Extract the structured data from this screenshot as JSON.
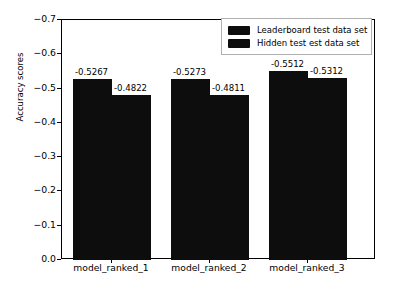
{
  "chart_data": {
    "type": "bar",
    "title": "",
    "xlabel": "",
    "ylabel": "Accuracy scores",
    "categories": [
      "model_ranked_1",
      "model_ranked_2",
      "model_ranked_3"
    ],
    "series": [
      {
        "name": "Leaderboard test data set",
        "values": [
          -0.5267,
          -0.4822,
          -0.5512
        ],
        "color": "#0d0d0d"
      },
      {
        "name": "Hidden test est data set",
        "values": [
          -0.4822,
          -0.4811,
          -0.5312
        ],
        "color": "#0d0d0d"
      }
    ],
    "bars": [
      {
        "group": "model_ranked_1",
        "series": "Leaderboard test data set",
        "value": -0.5267,
        "label": "-0.5267"
      },
      {
        "group": "model_ranked_1",
        "series": "Hidden test est data set",
        "value": -0.4822,
        "label": "-0.4822"
      },
      {
        "group": "model_ranked_2",
        "series": "Leaderboard test data set",
        "value": -0.5273,
        "label": "-0.5273"
      },
      {
        "group": "model_ranked_2",
        "series": "Hidden test est data set",
        "value": -0.4811,
        "label": "-0.4811"
      },
      {
        "group": "model_ranked_3",
        "series": "Leaderboard test data set",
        "value": -0.5512,
        "label": "-0.5512"
      },
      {
        "group": "model_ranked_3",
        "series": "Hidden test est data set",
        "value": -0.5312,
        "label": "-0.5312"
      }
    ],
    "yticks": [
      "-0.7",
      "-0.6",
      "-0.5",
      "-0.4",
      "-0.3",
      "-0.2",
      "-0.1",
      "0.0"
    ],
    "ylim": [
      0.0,
      -0.7
    ],
    "y_axis_inverted": true,
    "grid": false,
    "legend_position": "upper right",
    "legend": [
      "Leaderboard test data set",
      "Hidden test est data set"
    ],
    "bar_color": "#0d0d0d",
    "background": "#ffffff"
  }
}
